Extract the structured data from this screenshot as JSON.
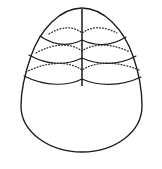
{
  "figure": {
    "title": "Ovoid surface with latitudinal band construction lines",
    "background_color": "#ffffff",
    "stroke_color": "#1a1a1a",
    "dotted_stroke_color": "#2b2b2b",
    "canvas": {
      "width": 162,
      "height": 169
    },
    "outline": {
      "name": "egg-outline",
      "apex_x": 82,
      "apex_y": 8,
      "bottom_y": 152,
      "left_x": 21,
      "right_x": 142,
      "widest_y": 110,
      "path": "M 82 8 C 104 8 124 30 133 56 C 140 76 142 92 142 106 C 142 132 115 152 82 152 C 49 152 21 132 21 106 C 21 92 24 76 31 56 C 40 30 60 8 82 8 Z"
    },
    "meridian": {
      "name": "vertical-meridian",
      "x": 82,
      "y_top": 9,
      "y_bottom": 86,
      "path": "M 82 9 L 82 86"
    },
    "bands": [
      {
        "index": 1,
        "label": "band-1",
        "dotted": {
          "left_x": 49,
          "right_x": 117,
          "y_end": 33,
          "apex_y": 28,
          "path": "M 49 34 C 60 27 72 25 82 33 C 93 25 106 27 117 33"
        },
        "solid": {
          "left_x": 40,
          "right_x": 126,
          "y_end": 36,
          "sag_y": 45,
          "path": "M 40 36 C 56 47 70 46 82 40 C 95 46 110 47 126 37"
        }
      },
      {
        "index": 2,
        "label": "band-2",
        "dotted": {
          "left_x": 36,
          "right_x": 130,
          "y_end": 52,
          "apex_y": 45,
          "path": "M 36 53 C 52 44 70 42 82 51 C 95 42 113 44 130 52"
        },
        "solid": {
          "left_x": 29,
          "right_x": 136,
          "y_end": 55,
          "sag_y": 64,
          "path": "M 29 55 C 48 66 68 65 82 58 C 97 65 118 66 136 56"
        }
      },
      {
        "index": 3,
        "label": "band-3",
        "dotted": {
          "left_x": 26,
          "right_x": 139,
          "y_end": 71,
          "apex_y": 63,
          "path": "M 26 72 C 46 62 68 60 82 70 C 97 60 120 62 139 70"
        },
        "solid": {
          "left_x": 24,
          "right_x": 141,
          "y_end": 76,
          "sag_y": 85,
          "path": "M 24 76 C 46 87 68 86 82 79 C 97 86 120 87 141 77"
        }
      }
    ]
  }
}
